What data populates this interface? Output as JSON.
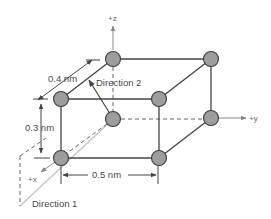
{
  "figure": {
    "type": "unit-cell-diagram",
    "axes": {
      "z": "+z",
      "y": "+y",
      "x": "+x"
    },
    "dimensions": {
      "a": "0.4 nm",
      "b": "0.5 nm",
      "c": "0.3 nm"
    },
    "directions": {
      "direction1": "Direction 1",
      "direction2": "Direction 2"
    },
    "atoms": {
      "count": 8,
      "positions": [
        "back-top-left",
        "back-top-right",
        "front-top-left",
        "front-top-right",
        "back-bottom-left",
        "back-bottom-right",
        "front-bottom-left",
        "front-bottom-right"
      ]
    },
    "colors": {
      "atom_fill": "#9d9d9d",
      "atom_stroke": "#3c3c3c",
      "edge": "#444444",
      "axis": "#888888",
      "direction1_line": "#c8c8c8",
      "text": "#4a4a4a"
    }
  }
}
